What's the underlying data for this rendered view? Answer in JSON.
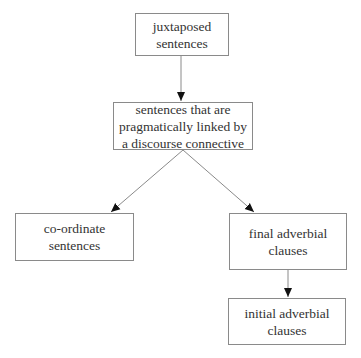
{
  "diagram": {
    "type": "flowchart",
    "nodes": [
      {
        "id": "juxtaposed",
        "label": "juxtaposed\nsentences"
      },
      {
        "id": "pragmatic",
        "label": "sentences that are\npragmatically linked by\na discourse connective"
      },
      {
        "id": "coordinate",
        "label": "co-ordinate\nsentences"
      },
      {
        "id": "final",
        "label": "final adverbial\nclauses"
      },
      {
        "id": "initial",
        "label": "initial adverbial\nclauses"
      }
    ],
    "edges": [
      {
        "from": "juxtaposed",
        "to": "pragmatic"
      },
      {
        "from": "pragmatic",
        "to": "coordinate"
      },
      {
        "from": "pragmatic",
        "to": "final"
      },
      {
        "from": "final",
        "to": "initial"
      }
    ],
    "colors": {
      "border": "#8a8a8a",
      "edge": "#8a8a8a",
      "arrowhead": "#111111",
      "text": "#333333",
      "background": "#ffffff"
    }
  }
}
